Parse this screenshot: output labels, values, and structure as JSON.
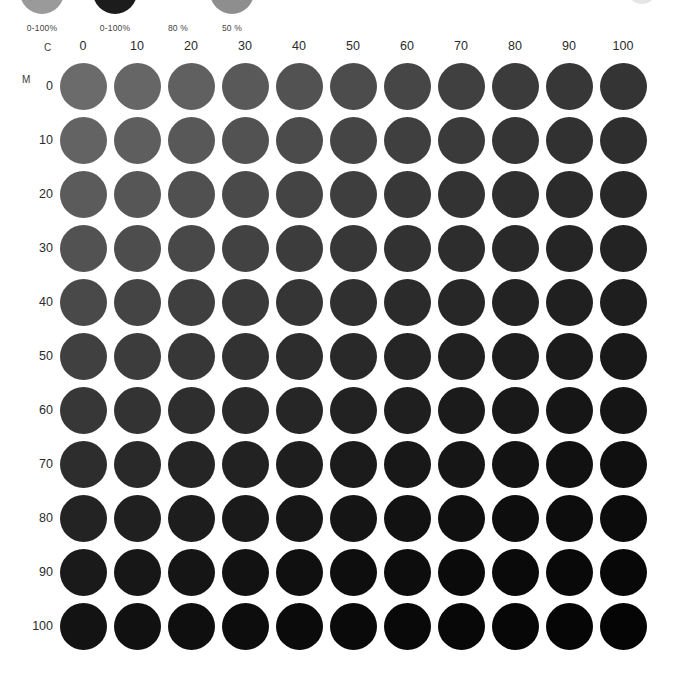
{
  "legend": {
    "items": [
      {
        "label": "0-100%",
        "swatch_color": "#9a9a9a",
        "has_swatch": true
      },
      {
        "label": "0-100%",
        "swatch_color": "#1c1c1c",
        "has_swatch": true
      },
      {
        "label": "80 %",
        "swatch_color": "#ffffff",
        "has_swatch": false
      },
      {
        "label": "50 %",
        "swatch_color": "#8e8e8e",
        "has_swatch": true
      }
    ],
    "corner_mark": "partial-circle-mark"
  },
  "chart_data": {
    "type": "heatmap",
    "title": "",
    "xlabel": "C",
    "ylabel": "M",
    "categories": [
      "0",
      "10",
      "20",
      "30",
      "40",
      "50",
      "60",
      "70",
      "80",
      "90",
      "100"
    ],
    "rows": [
      "0",
      "10",
      "20",
      "30",
      "40",
      "50",
      "60",
      "70",
      "80",
      "90",
      "100"
    ],
    "grid": false,
    "legend_position": "top",
    "note": "CMY tone-value grid rendered in grayscale; cell tone darkens as C and M increase",
    "values": [
      [
        107,
        102,
        96,
        89,
        82,
        76,
        70,
        64,
        59,
        55,
        52
      ],
      [
        99,
        94,
        88,
        82,
        75,
        69,
        63,
        58,
        53,
        49,
        46
      ],
      [
        91,
        86,
        80,
        74,
        68,
        62,
        56,
        51,
        47,
        43,
        40
      ],
      [
        82,
        77,
        72,
        66,
        60,
        55,
        50,
        45,
        41,
        37,
        35
      ],
      [
        73,
        68,
        63,
        58,
        53,
        48,
        43,
        39,
        35,
        32,
        30
      ],
      [
        64,
        60,
        55,
        50,
        45,
        41,
        37,
        33,
        30,
        27,
        25
      ],
      [
        55,
        51,
        46,
        42,
        38,
        34,
        31,
        27,
        25,
        22,
        21
      ],
      [
        45,
        41,
        37,
        34,
        30,
        27,
        24,
        22,
        19,
        17,
        16
      ],
      [
        35,
        32,
        29,
        26,
        23,
        21,
        18,
        16,
        14,
        13,
        12
      ],
      [
        26,
        23,
        21,
        18,
        16,
        14,
        13,
        11,
        10,
        9,
        8
      ],
      [
        19,
        17,
        15,
        13,
        11,
        10,
        9,
        8,
        7,
        6,
        5
      ]
    ],
    "colors": [
      [
        "#6b6b6b",
        "#666666",
        "#606060",
        "#595959",
        "#525252",
        "#4c4c4c",
        "#464646",
        "#404040",
        "#3b3b3b",
        "#373737",
        "#343434"
      ],
      [
        "#636363",
        "#5e5e5e",
        "#585858",
        "#525252",
        "#4b4b4b",
        "#454545",
        "#3f3f3f",
        "#3a3a3a",
        "#353535",
        "#313131",
        "#2e2e2e"
      ],
      [
        "#5b5b5b",
        "#565656",
        "#505050",
        "#4a4a4a",
        "#444444",
        "#3e3e3e",
        "#383838",
        "#333333",
        "#2f2f2f",
        "#2b2b2b",
        "#282828"
      ],
      [
        "#525252",
        "#4d4d4d",
        "#484848",
        "#424242",
        "#3c3c3c",
        "#373737",
        "#323232",
        "#2d2d2d",
        "#292929",
        "#252525",
        "#232323"
      ],
      [
        "#494949",
        "#444444",
        "#3f3f3f",
        "#3a3a3a",
        "#353535",
        "#303030",
        "#2b2b2b",
        "#272727",
        "#232323",
        "#202020",
        "#1e1e1e"
      ],
      [
        "#404040",
        "#3c3c3c",
        "#373737",
        "#323232",
        "#2d2d2d",
        "#292929",
        "#252525",
        "#212121",
        "#1e1e1e",
        "#1b1b1b",
        "#191919"
      ],
      [
        "#373737",
        "#333333",
        "#2e2e2e",
        "#2a2a2a",
        "#262626",
        "#222222",
        "#1f1f1f",
        "#1b1b1b",
        "#191919",
        "#161616",
        "#151515"
      ],
      [
        "#2d2d2d",
        "#292929",
        "#252525",
        "#222222",
        "#1e1e1e",
        "#1b1b1b",
        "#181818",
        "#161616",
        "#131313",
        "#111111",
        "#101010"
      ],
      [
        "#232323",
        "#202020",
        "#1d1d1d",
        "#1a1a1a",
        "#171717",
        "#151515",
        "#121212",
        "#101010",
        "#0e0e0e",
        "#0d0d0d",
        "#0c0c0c"
      ],
      [
        "#1a1a1a",
        "#171717",
        "#151515",
        "#121212",
        "#101010",
        "#0e0e0e",
        "#0d0d0d",
        "#0b0b0b",
        "#0a0a0a",
        "#090909",
        "#080808"
      ],
      [
        "#131313",
        "#111111",
        "#0f0f0f",
        "#0d0d0d",
        "#0b0b0b",
        "#0a0a0a",
        "#090909",
        "#080808",
        "#070707",
        "#060606",
        "#050505"
      ]
    ]
  }
}
